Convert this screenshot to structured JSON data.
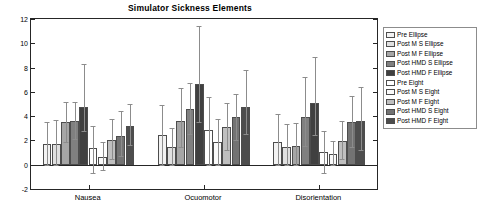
{
  "chart_data": {
    "type": "bar",
    "title": "Simulator Sickness Elements",
    "xlabel": "",
    "ylabel": "",
    "ylim": [
      -2,
      12
    ],
    "ytick_labels": [
      "-2",
      "0",
      "2",
      "4",
      "6",
      "8",
      "10",
      "12"
    ],
    "ytick_values": [
      -2,
      0,
      2,
      4,
      6,
      8,
      10,
      12
    ],
    "grid": false,
    "legend_position": "outside right",
    "categories": [
      "Nausea",
      "Ocuomotor",
      "Disorientation"
    ],
    "series": [
      {
        "name": "Pre Ellipse",
        "color": "#f2f2f2",
        "values": [
          1.7,
          2.45,
          1.9
        ],
        "err_upper": [
          1.85,
          2.45,
          2.25
        ],
        "err_lower": [
          1.7,
          2.45,
          1.9
        ]
      },
      {
        "name": "Post M S Ellipse",
        "color": "#e0e0e0",
        "values": [
          1.7,
          1.45,
          1.45
        ],
        "err_upper": [
          1.95,
          1.6,
          1.9
        ],
        "err_lower": [
          1.7,
          1.45,
          1.45
        ]
      },
      {
        "name": "Post M F Ellipse",
        "color": "#a6a6a6",
        "values": [
          3.5,
          3.6,
          1.55
        ],
        "err_upper": [
          1.7,
          2.7,
          1.85
        ],
        "err_lower": [
          1.6,
          2.15,
          1.55
        ]
      },
      {
        "name": "Post HMD S Ellipse",
        "color": "#808080",
        "values": [
          3.6,
          4.55,
          3.95
        ],
        "err_upper": [
          1.55,
          2.15,
          3.3
        ],
        "err_lower": [
          1.5,
          2.0,
          2.4
        ]
      },
      {
        "name": "Post HMD F Ellipse",
        "color": "#404040",
        "values": [
          4.75,
          6.65,
          5.05
        ],
        "err_upper": [
          3.55,
          4.8,
          3.85
        ],
        "err_lower": [
          2.0,
          3.15,
          2.6
        ]
      },
      {
        "name": "Pre Eight",
        "color": "#ffffff",
        "values": [
          1.35,
          2.85,
          1.05
        ],
        "err_upper": [
          1.85,
          2.75,
          1.75
        ],
        "err_lower": [
          2.0,
          2.85,
          1.75
        ]
      },
      {
        "name": "Post M S Eight",
        "color": "#fafafa",
        "values": [
          0.65,
          1.85,
          0.85
        ],
        "err_upper": [
          1.2,
          1.9,
          1.1
        ],
        "err_lower": [
          1.1,
          1.85,
          0.85
        ]
      },
      {
        "name": "Post M F Eight",
        "color": "#bfbfbf",
        "values": [
          2.0,
          3.1,
          1.95
        ],
        "err_upper": [
          1.75,
          2.0,
          1.65
        ],
        "err_lower": [
          1.55,
          1.9,
          1.5
        ]
      },
      {
        "name": "Post HMD S Eight",
        "color": "#737373",
        "values": [
          2.4,
          3.9,
          3.5
        ],
        "err_upper": [
          2.0,
          1.9,
          2.2
        ],
        "err_lower": [
          1.7,
          1.85,
          2.0
        ]
      },
      {
        "name": "Post HMD F Eight",
        "color": "#4d4d4d",
        "values": [
          3.2,
          4.75,
          3.6
        ],
        "err_upper": [
          1.8,
          3.05,
          2.8
        ],
        "err_lower": [
          1.6,
          2.25,
          2.4
        ]
      }
    ]
  }
}
